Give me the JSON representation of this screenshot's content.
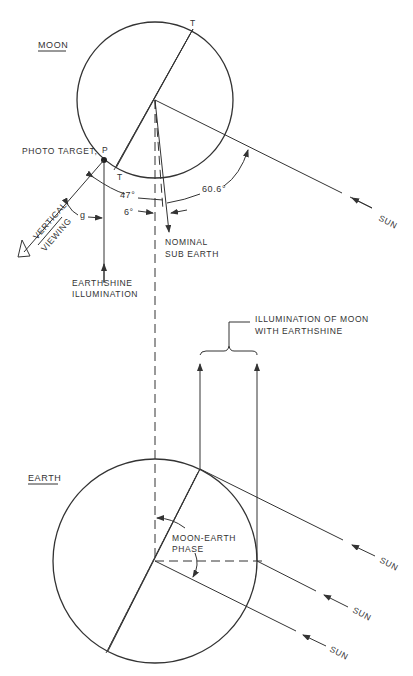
{
  "diagram": {
    "moon": {
      "title": "MOON",
      "terminator_label_top": "T",
      "terminator_label_bottom": "T",
      "photo_target_label": "PHOTO TARGET,",
      "photo_target_point": "P",
      "angle_sun": "60.6°",
      "angle_viewing": "47°",
      "angle_offset": "6°",
      "angle_g": "g",
      "nominal_sub_earth": [
        "NOMINAL",
        "SUB EARTH"
      ],
      "vertical_viewing": [
        "VERTICAL",
        "VIEWING"
      ],
      "earthshine_illumination": [
        "EARTHSHINE",
        "ILLUMINATION"
      ],
      "sun_label": "SUN"
    },
    "bracket_label": [
      "ILLUMINATION OF MOON",
      "WITH EARTHSHINE"
    ],
    "earth": {
      "title": "EARTH",
      "phase_label": [
        "MOON-EARTH",
        "PHASE"
      ],
      "sun_labels": [
        "SUN",
        "SUN",
        "SUN"
      ]
    }
  }
}
